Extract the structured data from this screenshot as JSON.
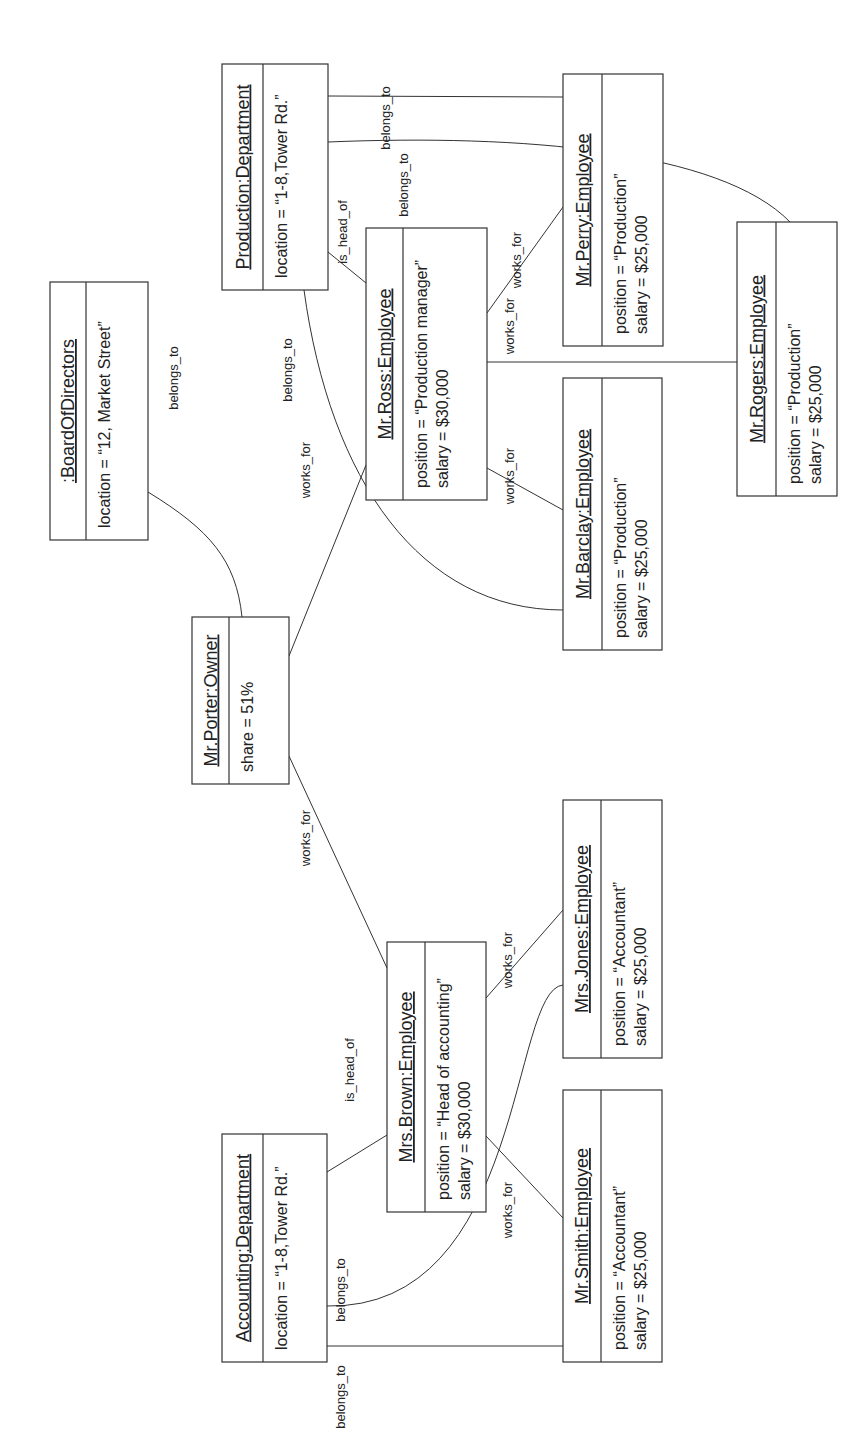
{
  "diagram": {
    "type": "UML object diagram",
    "orientation": "rotated 90deg counter-clockwise",
    "objects": [
      {
        "id": "board",
        "title": ":BoardOfDirectors",
        "attributes": [
          "location = “12, Market Street”"
        ],
        "box": [
          50,
          282,
          98,
          258
        ],
        "hdr": 36
      },
      {
        "id": "production",
        "title": "Production:Department",
        "attributes": [
          "location = “1-8,Tower Rd.”"
        ],
        "box": [
          222,
          64,
          106,
          226
        ],
        "hdr": 41
      },
      {
        "id": "ross",
        "title": "Mr.Ross:Employee",
        "attributes": [
          "position = “Production manager”",
          "salary = $30,000"
        ],
        "box": [
          366,
          228,
          121,
          272
        ],
        "hdr": 37
      },
      {
        "id": "perry",
        "title": "Mr.Perry:Employee",
        "attributes": [
          "position = “Production”",
          "salary = $25,000"
        ],
        "box": [
          563,
          74,
          100,
          272
        ],
        "hdr": 39
      },
      {
        "id": "rogers",
        "title": "Mr.Rogers:Employee",
        "attributes": [
          "position = “Production”",
          "salary = $25,000"
        ],
        "box": [
          737,
          222,
          100,
          274
        ],
        "hdr": 39
      },
      {
        "id": "barclay",
        "title": "Mr.Barclay:Employee",
        "attributes": [
          "position = “Production”",
          "salary = $25,000"
        ],
        "box": [
          563,
          378,
          99,
          272
        ],
        "hdr": 39
      },
      {
        "id": "porter",
        "title": "Mr.Porter:Owner",
        "attributes": [
          "share = 51%"
        ],
        "box": [
          192,
          617,
          97,
          167
        ],
        "hdr": 37
      },
      {
        "id": "brown",
        "title": "Mrs.Brown:Employee",
        "attributes": [
          "position = “Head of accounting”",
          "salary = $30,000"
        ],
        "box": [
          387,
          942,
          99,
          270
        ],
        "hdr": 38
      },
      {
        "id": "jones",
        "title": "Mrs.Jones:Employee",
        "attributes": [
          "position = “Accountant”",
          "salary = $25,000"
        ],
        "box": [
          563,
          800,
          99,
          258
        ],
        "hdr": 38
      },
      {
        "id": "smith",
        "title": "Mr.Smith:Employee",
        "attributes": [
          "position = “Accountant”",
          "salary = $25,000"
        ],
        "box": [
          563,
          1090,
          99,
          272
        ],
        "hdr": 38
      },
      {
        "id": "accounting",
        "title": "Accounting:Department",
        "attributes": [
          "location = “1-8,Tower Rd.”"
        ],
        "box": [
          222,
          1134,
          105,
          228
        ],
        "hdr": 41
      }
    ],
    "links": [
      {
        "id": "porter-board",
        "label": "belongs_to",
        "path": "M242,617 C236,560 210,530 148,492",
        "lx": 178,
        "ly": 378
      },
      {
        "id": "porter-ross",
        "label": "works_for",
        "path": "M289,656 L366,465",
        "lx": 310,
        "ly": 470
      },
      {
        "id": "porter-brown",
        "label": "works_for",
        "path": "M289,756 L387,968",
        "lx": 310,
        "ly": 838
      },
      {
        "id": "ross-production",
        "label": "is_head_of",
        "path": "M366,283 L328,252",
        "lx": 347,
        "ly": 232
      },
      {
        "id": "barclay-production",
        "label": "belongs_to",
        "path": "M563,610 C420,610 330,480 304,290",
        "lx": 292,
        "ly": 370
      },
      {
        "id": "ross-barclay",
        "label": "works_for",
        "path": "M487,468 L563,510",
        "lx": 514,
        "ly": 476
      },
      {
        "id": "ross-perry",
        "label": "works_for",
        "path": "M487,313 L563,207",
        "lx": 514,
        "ly": 326
      },
      {
        "id": "ross-perry-2",
        "label": "works_for",
        "path": "",
        "lx": 521,
        "ly": 260
      },
      {
        "id": "ross-rogers",
        "label": "works_for",
        "path": "M487,362 L737,362",
        "lx": 0,
        "ly": 0
      },
      {
        "id": "perry-production",
        "label": "belongs_to",
        "path": "M328,96 L563,97",
        "lx": 390,
        "ly": 118
      },
      {
        "id": "rogers-production",
        "label": "belongs_to",
        "path": "M328,142 C520,134 720,150 790,222",
        "lx": 408,
        "ly": 185
      },
      {
        "id": "brown-accounting",
        "label": "is_head_of",
        "path": "M387,1135 L327,1172",
        "lx": 354,
        "ly": 1070
      },
      {
        "id": "brown-jones",
        "label": "works_for",
        "path": "M486,998 L563,910",
        "lx": 512,
        "ly": 960
      },
      {
        "id": "brown-smith",
        "label": "works_for",
        "path": "M486,1136 L563,1218",
        "lx": 512,
        "ly": 1210
      },
      {
        "id": "jones-accounting",
        "label": "belongs_to",
        "path": "M563,985 C510,990 525,1310 327,1306",
        "lx": 345,
        "ly": 1290
      },
      {
        "id": "smith-accounting",
        "label": "belongs_to",
        "path": "M327,1346 L563,1346",
        "lx": 345,
        "ly": 1397
      }
    ]
  }
}
